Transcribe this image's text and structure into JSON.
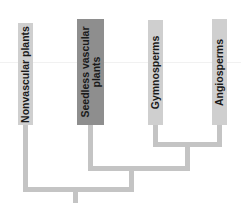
{
  "diagram": {
    "type": "cladogram",
    "taxa": [
      {
        "label": "Nonvascular plants",
        "highlighted": false
      },
      {
        "label": "Seedless vascular\nplants",
        "highlighted": true
      },
      {
        "label": "Gymnosperms",
        "highlighted": false
      },
      {
        "label": "Angiosperms",
        "highlighted": false
      }
    ],
    "colors": {
      "box_default": "#cfcfcf",
      "box_highlight": "#8e8e8e",
      "branch": "#c4c4c4"
    }
  }
}
